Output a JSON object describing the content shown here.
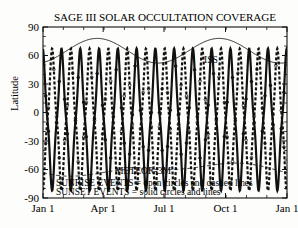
{
  "chart_data": {
    "type": "line",
    "title": "SAGE III SOLAR OCCULTATION COVERAGE",
    "xlabel": "",
    "ylabel": "Latitude",
    "xlim": [
      0,
      365
    ],
    "ylim": [
      -90,
      90
    ],
    "grid": false,
    "x_tick_labels": [
      "Jan 1",
      "Apr 1",
      "Jul 1",
      "Oct 1",
      "Jan 1"
    ],
    "x_tick_values": [
      0,
      90,
      181,
      273,
      365
    ],
    "y_tick_labels": [
      "90",
      "60",
      "30",
      "0",
      "-30",
      "-60",
      "-90"
    ],
    "y_tick_values": [
      90,
      60,
      30,
      0,
      -30,
      -60,
      -90
    ],
    "annotations": [
      {
        "text": "ISS",
        "x": 300,
        "y": 64
      },
      {
        "text": "METEOR-3M",
        "x": 150,
        "y": -57
      }
    ],
    "series": [
      {
        "name": "ISS",
        "style": "thin-solid-line",
        "comment": "Slow ~2-cycle oscillation of ISS occultation latitude envelope",
        "amplitude": 13,
        "mean": 65,
        "cycles": 2.0,
        "phase_deg": -70
      },
      {
        "name": "METEOR-3M",
        "style": "dashed-line",
        "comment": "Southern-hemisphere dashed envelope near -55 to -66",
        "amplitude": 5,
        "mean": -60,
        "cycles": 1.0,
        "phase_deg": 200
      },
      {
        "name": "SAGE III sunset events",
        "style": "solid-circles-and-lines",
        "comment": "Rapidly oscillating occultation latitude, 13 cycles per year, range +57 to -72",
        "cycles": 13,
        "upper": 57,
        "lower": -72
      },
      {
        "name": "SAGE III sunrise events",
        "style": "open-circles-and-dashed-lines",
        "comment": "Counter-phase rapid oscillation, same range",
        "cycles": 13,
        "upper": 57,
        "lower": -72
      }
    ]
  },
  "legend": {
    "line1": "SUNRISE EVENTS = open circles and dashed lines",
    "line2": "SUNSET EVENTS = solid circles and lines"
  },
  "labels": {
    "iss": "ISS",
    "meteor": "METEOR-3M",
    "latitude": "Latitude"
  },
  "colors": {
    "axis": "#111111",
    "curve": "#1a1a1a",
    "background": "#fdfdfb"
  }
}
